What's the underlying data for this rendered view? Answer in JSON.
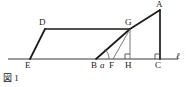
{
  "figure": {
    "caption": "図 1",
    "axis_label": "ℓ",
    "angle_label": "a",
    "stroke_color": "#1a1a1a",
    "thin_stroke_color": "#555555",
    "background": "#ffffff",
    "vertices": [
      {
        "id": "A",
        "label": "A",
        "x": 160,
        "y": 10,
        "label_x": 157,
        "label_y": 0
      },
      {
        "id": "D",
        "label": "D",
        "x": 45,
        "y": 29,
        "label_x": 40,
        "label_y": 18
      },
      {
        "id": "G",
        "label": "G",
        "x": 130,
        "y": 29,
        "label_x": 126,
        "label_y": 18
      },
      {
        "id": "E",
        "label": "E",
        "x": 30,
        "y": 59,
        "label_x": 26,
        "label_y": 61
      },
      {
        "id": "B",
        "label": "B",
        "x": 96,
        "y": 59,
        "label_x": 92,
        "label_y": 61
      },
      {
        "id": "F",
        "label": "F",
        "x": 113,
        "y": 59,
        "label_x": 110,
        "label_y": 61
      },
      {
        "id": "H",
        "label": "H",
        "x": 130,
        "y": 59,
        "label_x": 126,
        "label_y": 61
      },
      {
        "id": "C",
        "label": "C",
        "x": 160,
        "y": 59,
        "label_x": 156,
        "label_y": 61
      }
    ],
    "segments": [
      {
        "name": "line-l",
        "from": "axis-left",
        "x1": 8,
        "y1": 59,
        "x2": 178,
        "y2": 59,
        "weight": "thin"
      },
      {
        "name": "seg-E-D",
        "x1": 30,
        "y1": 59,
        "x2": 45,
        "y2": 29,
        "weight": "bold"
      },
      {
        "name": "seg-D-G",
        "x1": 45,
        "y1": 29,
        "x2": 130,
        "y2": 29,
        "weight": "bold"
      },
      {
        "name": "seg-B-G",
        "x1": 96,
        "y1": 59,
        "x2": 130,
        "y2": 29,
        "weight": "bold"
      },
      {
        "name": "seg-G-A",
        "x1": 130,
        "y1": 29,
        "x2": 160,
        "y2": 10,
        "weight": "bold"
      },
      {
        "name": "seg-A-C",
        "x1": 160,
        "y1": 10,
        "x2": 160,
        "y2": 59,
        "weight": "bold"
      },
      {
        "name": "seg-F-G",
        "x1": 113,
        "y1": 59,
        "x2": 130,
        "y2": 29,
        "weight": "thin"
      },
      {
        "name": "seg-G-H",
        "x1": 130,
        "y1": 29,
        "x2": 130,
        "y2": 59,
        "weight": "thin"
      }
    ],
    "right_angles": [
      {
        "name": "right-angle-H",
        "x": 130,
        "y": 59,
        "size": 5,
        "dir_x": -1
      },
      {
        "name": "right-angle-C",
        "x": 160,
        "y": 59,
        "size": 5,
        "dir_x": -1
      }
    ],
    "angle_arc": {
      "name": "angle-a-at-B",
      "vertex_x": 96,
      "vertex_y": 59,
      "radius": 13,
      "label_x": 103,
      "label_y": 61
    },
    "axis_label_pos": {
      "x": 176,
      "y": 52
    }
  }
}
